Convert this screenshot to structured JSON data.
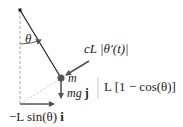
{
  "diagram": {
    "labels": {
      "theta": "θ",
      "damping_force": "cL |θ′(t)|",
      "mass": "m",
      "gravity": "mg j",
      "gravity_prefix": "mg",
      "gravity_unit": "j",
      "height": "L [1 − cos(θ)]",
      "horizontal": "−L sin(θ) i",
      "horizontal_text": "−L sin(θ)",
      "horizontal_unit": "i"
    },
    "colors": {
      "rod": "#222222",
      "arrow": "#555555",
      "dashed": "#aaaaaa",
      "text": "#222222"
    }
  }
}
